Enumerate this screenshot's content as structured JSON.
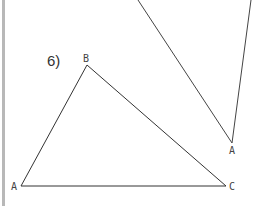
{
  "worksheet": {
    "problem_number": "6)",
    "triangle_main": {
      "vertices": [
        {
          "label": "A",
          "x": 21,
          "y": 186
        },
        {
          "label": "B",
          "x": 87,
          "y": 65
        },
        {
          "label": "C",
          "x": 226,
          "y": 186
        }
      ]
    },
    "triangle_partial": {
      "vertices": [
        {
          "label": "A",
          "x": 232,
          "y": 143
        }
      ]
    },
    "colors": {
      "line": "#333333",
      "margin": "#b8b8b8"
    }
  }
}
